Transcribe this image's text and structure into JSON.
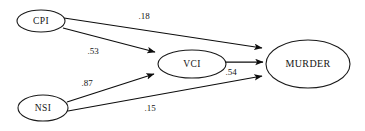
{
  "diagram": {
    "type": "path-analysis-diagram",
    "background_color": "#ffffff",
    "line_color": "#0d0d0d",
    "text_color": "#141414",
    "nodes": [
      {
        "id": "cpi",
        "label": "CPI",
        "cx": 41,
        "cy": 21,
        "rx": 24,
        "ry": 11
      },
      {
        "id": "nsi",
        "label": "NSI",
        "cx": 43,
        "cy": 108,
        "rx": 25,
        "ry": 13
      },
      {
        "id": "vci",
        "label": "VCI",
        "cx": 192,
        "cy": 64,
        "rx": 34,
        "ry": 14
      },
      {
        "id": "murder",
        "label": "MURDER",
        "cx": 308,
        "cy": 64,
        "rx": 42,
        "ry": 24
      }
    ],
    "edges": [
      {
        "id": "cpi-murder",
        "from": "CPI",
        "to": "MURDER",
        "coefficient": ".18",
        "x1": 64,
        "y1": 18,
        "x2": 264,
        "y2": 48,
        "lx": 144,
        "ly": 17
      },
      {
        "id": "cpi-vci",
        "from": "CPI",
        "to": "VCI",
        "coefficient": ".53",
        "x1": 63,
        "y1": 28,
        "x2": 157,
        "y2": 52,
        "lx": 93,
        "ly": 52
      },
      {
        "id": "nsi-vci",
        "from": "NSI",
        "to": "VCI",
        "coefficient": ".87",
        "x1": 67,
        "y1": 102,
        "x2": 156,
        "y2": 74,
        "lx": 87,
        "ly": 84
      },
      {
        "id": "nsi-murder",
        "from": "NSI",
        "to": "MURDER",
        "coefficient": ".15",
        "x1": 68,
        "y1": 111,
        "x2": 264,
        "y2": 76,
        "lx": 150,
        "ly": 109
      },
      {
        "id": "vci-murder",
        "from": "VCI",
        "to": "MURDER",
        "coefficient": ".54",
        "x1": 226,
        "y1": 62,
        "x2": 264,
        "y2": 62,
        "lx": 231,
        "ly": 73
      }
    ]
  }
}
